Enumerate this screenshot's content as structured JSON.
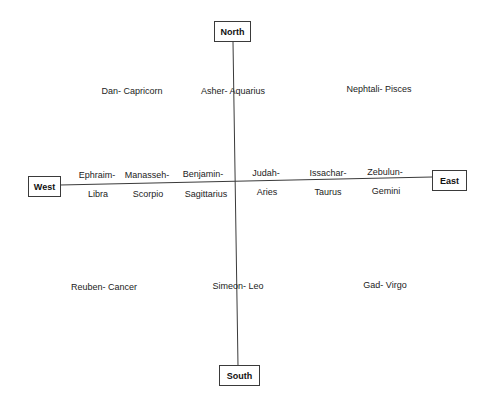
{
  "diagram": {
    "directions": {
      "north": "North",
      "south": "South",
      "east": "East",
      "west": "West"
    },
    "corners": {
      "northwest": "Dan- Capricorn",
      "north": "Asher- Aquarius",
      "northeast": "Nephtali- Pisces",
      "southwest": "Reuben- Cancer",
      "south": "Simeon- Leo",
      "southeast": "Gad- Virgo"
    },
    "axis_pairs": [
      {
        "tribe": "Ephraim-",
        "sign": "Libra"
      },
      {
        "tribe": "Manasseh-",
        "sign": "Scorpio"
      },
      {
        "tribe": "Benjamin-",
        "sign": "Sagittarius"
      },
      {
        "tribe": "Judah-",
        "sign": "Aries"
      },
      {
        "tribe": "Issachar-",
        "sign": "Taurus"
      },
      {
        "tribe": "Zebulun-",
        "sign": "Gemini"
      }
    ],
    "colors": {
      "line": "#3a3a3a",
      "text": "#222222",
      "background": "#ffffff"
    }
  }
}
